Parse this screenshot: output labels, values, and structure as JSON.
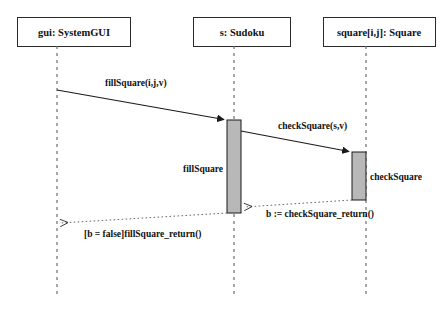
{
  "diagram": {
    "type": "uml-sequence-diagram",
    "background_color": "#ffffff",
    "line_color": "#222222",
    "activation_fill": "#b8b8b8",
    "text_color": "#111111",
    "lifelines": [
      {
        "id": "gui",
        "label": "gui: SystemGUI",
        "box": {
          "x": 17,
          "y": 17,
          "w": 113,
          "h": 29
        },
        "line_x": 57,
        "line_top": 46,
        "line_bottom": 298
      },
      {
        "id": "sudoku",
        "label": "s: Sudoku",
        "box": {
          "x": 193,
          "y": 17,
          "w": 97,
          "h": 29
        },
        "line_x": 234,
        "line_top": 46,
        "line_bottom": 298
      },
      {
        "id": "square",
        "label": "square[i,j]: Square",
        "box": {
          "x": 323,
          "y": 17,
          "w": 112,
          "h": 29
        },
        "line_x": 366,
        "line_top": 46,
        "line_bottom": 298
      }
    ],
    "activations": [
      {
        "id": "activation-fillsquare",
        "label": "fillSquare",
        "lifeline": "sudoku",
        "x": 227,
        "y": 120,
        "w": 14,
        "h": 93,
        "label_x": 223,
        "label_y": 169,
        "label_anchor": "end"
      },
      {
        "id": "activation-checksquare",
        "label": "checkSquare",
        "lifeline": "square",
        "x": 352,
        "y": 152,
        "w": 14,
        "h": 48,
        "label_x": 370,
        "label_y": 179,
        "label_anchor": "start"
      }
    ],
    "messages": [
      {
        "id": "message-fillsquare",
        "label": "fillSquare(i,j,v)",
        "style": "solid",
        "from": "gui",
        "to": "sudoku",
        "x1": 57,
        "y1": 90,
        "x2": 226,
        "y2": 120,
        "label_x": 105,
        "label_y": 86,
        "label_anchor": "start"
      },
      {
        "id": "message-checksquare",
        "label": "checkSquare(s,v)",
        "style": "solid",
        "from": "sudoku",
        "to": "square",
        "x1": 241,
        "y1": 131,
        "x2": 351,
        "y2": 152,
        "label_x": 278,
        "label_y": 129,
        "label_anchor": "start"
      },
      {
        "id": "message-checksquare-return",
        "label": "b := checkSquare_return()",
        "style": "dotted",
        "from": "square",
        "to": "sudoku",
        "x1": 352,
        "y1": 200,
        "x2": 242,
        "y2": 207,
        "label_x": 266,
        "label_y": 216,
        "label_anchor": "start"
      },
      {
        "id": "message-fillsquare-return",
        "label": "[b = false]fillSquare_return()",
        "style": "dotted",
        "from": "sudoku",
        "to": "gui",
        "x1": 227,
        "y1": 213,
        "x2": 58,
        "y2": 223,
        "label_x": 84,
        "label_y": 236,
        "label_anchor": "start"
      }
    ]
  }
}
